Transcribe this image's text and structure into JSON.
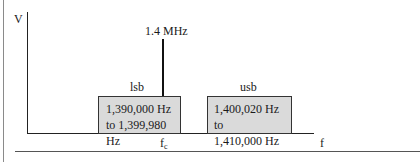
{
  "diagram": {
    "type": "frequency-spectrum",
    "y_axis_label": "V",
    "x_axis_label": "f",
    "carrier": {
      "label": "1.4 MHz",
      "axis_mark": "f",
      "axis_mark_sub": "c"
    },
    "lower_sideband": {
      "label": "lsb",
      "line1": "1,390,000 Hz",
      "line2": "to 1,399,980 Hz"
    },
    "upper_sideband": {
      "label": "usb",
      "line1": "1,400,020 Hz to",
      "line2": "1,410,000 Hz"
    },
    "colors": {
      "band_fill": "#dadada",
      "line": "#222222"
    }
  }
}
